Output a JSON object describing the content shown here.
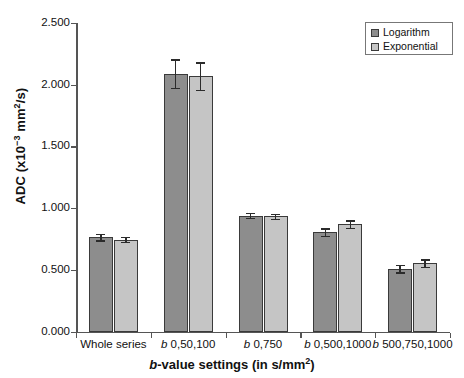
{
  "chart_data": {
    "type": "bar",
    "title": "",
    "subtitle": "",
    "xlabel": "b-value settings (in s/mm2)",
    "ylabel": "ADC (x10-3 mm2/s)",
    "categories": [
      "Whole series",
      "b 0,50,100",
      "b 0,750",
      "b 0,500,1000",
      "b 500,750,1000"
    ],
    "ylim": [
      0.0,
      2.5
    ],
    "ytick_labels": [
      "0.000",
      "0.500",
      "1.000",
      "1.500",
      "2.000",
      "2.500"
    ],
    "ytick_values": [
      0.0,
      0.5,
      1.0,
      1.5,
      2.0,
      2.5
    ],
    "grid": false,
    "legend_position": "top-right",
    "series": [
      {
        "name": "Logarithm",
        "color": "#8d8d8d",
        "values": [
          0.765,
          2.09,
          0.94,
          0.805,
          0.51
        ],
        "errors": [
          0.025,
          0.115,
          0.02,
          0.03,
          0.03
        ]
      },
      {
        "name": "Exponential",
        "color": "#c5c5c5",
        "values": [
          0.745,
          2.07,
          0.935,
          0.87,
          0.555
        ],
        "errors": [
          0.02,
          0.11,
          0.02,
          0.03,
          0.03
        ]
      }
    ]
  },
  "axes": {
    "y_title_main": "ADC (x10",
    "y_title_sup1": "−3",
    "y_title_mid": " mm",
    "y_title_sup2": "2",
    "y_title_tail": "/s)",
    "x_title_italic": "b",
    "x_title_main": "-value settings (in s/mm",
    "x_title_sup": "2",
    "x_title_tail": ")"
  },
  "xtick_labels": [
    {
      "italic": "",
      "text": "Whole series"
    },
    {
      "italic": "b",
      "text": " 0,50,100"
    },
    {
      "italic": "b",
      "text": " 0,750"
    },
    {
      "italic": "b",
      "text": " 0,500,1000"
    },
    {
      "italic": "b",
      "text": " 500,750,1000"
    }
  ],
  "legend": {
    "items": [
      {
        "label": "Logarithm",
        "color": "#8d8d8d"
      },
      {
        "label": "Exponential",
        "color": "#c5c5c5"
      }
    ]
  }
}
